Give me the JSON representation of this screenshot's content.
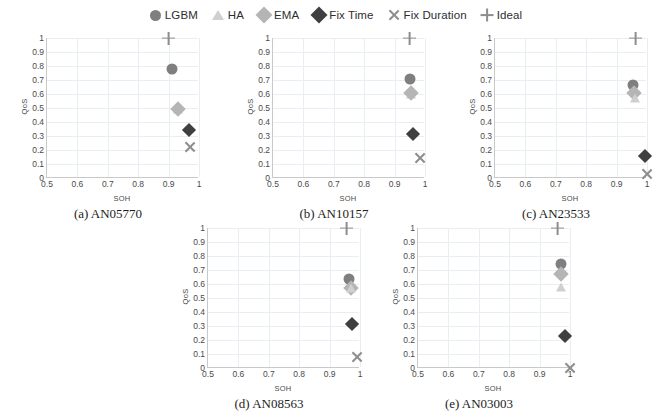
{
  "figure": {
    "xlabel": "SOH",
    "ylabel": "QoS",
    "xlim": [
      0.5,
      1.0
    ],
    "ylim": [
      0.0,
      1.0
    ],
    "xticks": [
      "0.5",
      "0.6",
      "0.7",
      "0.8",
      "0.9",
      "1"
    ],
    "yticks": [
      "0",
      "0.1",
      "0.2",
      "0.3",
      "0.4",
      "0.5",
      "0.6",
      "0.7",
      "0.8",
      "0.9",
      "1"
    ],
    "grid": true,
    "legend_position": "top-center"
  },
  "legend": {
    "items": [
      {
        "label": "LGBM",
        "marker": "circle",
        "color": "#7f7f7f",
        "icon": "circle-marker-icon"
      },
      {
        "label": "HA",
        "marker": "triangle",
        "color": "#cfcfcf",
        "icon": "triangle-marker-icon"
      },
      {
        "label": "EMA",
        "marker": "diamond",
        "color": "#b5b5b5",
        "icon": "diamond-marker-icon"
      },
      {
        "label": "Fix Time",
        "marker": "diamond",
        "color": "#3f3f3f",
        "icon": "diamond-marker-icon"
      },
      {
        "label": "Fix Duration",
        "marker": "x",
        "color": "#8d8d8d",
        "icon": "x-marker-icon"
      },
      {
        "label": "Ideal",
        "marker": "plus",
        "color": "#8d8d8d",
        "icon": "plus-marker-icon"
      }
    ]
  },
  "chart_data": [
    {
      "type": "scatter",
      "id": "a",
      "title": "(a) AN05770",
      "xlabel": "SOH",
      "ylabel": "QoS",
      "xlim": [
        0.5,
        1.0
      ],
      "ylim": [
        0.0,
        1.0
      ],
      "series": [
        {
          "name": "Ideal",
          "marker": "plus",
          "color": "#8d8d8d",
          "size": 13,
          "x": [
            0.9
          ],
          "y": [
            1.0
          ]
        },
        {
          "name": "LGBM",
          "marker": "circle",
          "color": "#7f7f7f",
          "size": 11,
          "x": [
            0.91
          ],
          "y": [
            0.78
          ]
        },
        {
          "name": "HA",
          "marker": "triangle",
          "color": "#cfcfcf",
          "size": 11,
          "x": [
            0.932
          ],
          "y": [
            0.49
          ]
        },
        {
          "name": "EMA",
          "marker": "diamond",
          "color": "#b5b5b5",
          "size": 11,
          "x": [
            0.932
          ],
          "y": [
            0.492
          ]
        },
        {
          "name": "Fix Time",
          "marker": "diamond",
          "color": "#3f3f3f",
          "size": 10,
          "x": [
            0.968
          ],
          "y": [
            0.34
          ]
        },
        {
          "name": "Fix Duration",
          "marker": "x",
          "color": "#8d8d8d",
          "size": 12,
          "x": [
            0.97
          ],
          "y": [
            0.22
          ]
        }
      ]
    },
    {
      "type": "scatter",
      "id": "b",
      "title": "(b) AN10157",
      "xlabel": "SOH",
      "ylabel": "QoS",
      "xlim": [
        0.5,
        1.0
      ],
      "ylim": [
        0.0,
        1.0
      ],
      "series": [
        {
          "name": "Ideal",
          "marker": "plus",
          "color": "#8d8d8d",
          "size": 13,
          "x": [
            0.95
          ],
          "y": [
            1.0
          ]
        },
        {
          "name": "LGBM",
          "marker": "circle",
          "color": "#7f7f7f",
          "size": 11,
          "x": [
            0.95
          ],
          "y": [
            0.705
          ]
        },
        {
          "name": "HA",
          "marker": "triangle",
          "color": "#cfcfcf",
          "size": 11,
          "x": [
            0.955
          ],
          "y": [
            0.6
          ]
        },
        {
          "name": "EMA",
          "marker": "diamond",
          "color": "#b5b5b5",
          "size": 11,
          "x": [
            0.955
          ],
          "y": [
            0.608
          ]
        },
        {
          "name": "Fix Time",
          "marker": "diamond",
          "color": "#3f3f3f",
          "size": 10,
          "x": [
            0.96
          ],
          "y": [
            0.315
          ]
        },
        {
          "name": "Fix Duration",
          "marker": "x",
          "color": "#8d8d8d",
          "size": 12,
          "x": [
            0.985
          ],
          "y": [
            0.14
          ]
        }
      ]
    },
    {
      "type": "scatter",
      "id": "c",
      "title": "(c) AN23533",
      "xlabel": "SOH",
      "ylabel": "QoS",
      "xlim": [
        0.5,
        1.0
      ],
      "ylim": [
        0.0,
        1.0
      ],
      "series": [
        {
          "name": "Ideal",
          "marker": "plus",
          "color": "#8d8d8d",
          "size": 13,
          "x": [
            0.962
          ],
          "y": [
            1.0
          ]
        },
        {
          "name": "LGBM",
          "marker": "circle",
          "color": "#7f7f7f",
          "size": 11,
          "x": [
            0.955
          ],
          "y": [
            0.665
          ]
        },
        {
          "name": "EMA",
          "marker": "diamond",
          "color": "#b5b5b5",
          "size": 11,
          "x": [
            0.958
          ],
          "y": [
            0.605
          ]
        },
        {
          "name": "HA",
          "marker": "triangle",
          "color": "#cfcfcf",
          "size": 11,
          "x": [
            0.96
          ],
          "y": [
            0.575
          ]
        },
        {
          "name": "Fix Time",
          "marker": "diamond",
          "color": "#3f3f3f",
          "size": 10,
          "x": [
            0.995
          ],
          "y": [
            0.155
          ]
        },
        {
          "name": "Fix Duration",
          "marker": "x",
          "color": "#8d8d8d",
          "size": 12,
          "x": [
            1.0
          ],
          "y": [
            0.03
          ]
        }
      ]
    },
    {
      "type": "scatter",
      "id": "d",
      "title": "(d) AN08563",
      "xlabel": "SOH",
      "ylabel": "QoS",
      "xlim": [
        0.5,
        1.0
      ],
      "ylim": [
        0.0,
        1.0
      ],
      "series": [
        {
          "name": "Ideal",
          "marker": "plus",
          "color": "#8d8d8d",
          "size": 13,
          "x": [
            0.955
          ],
          "y": [
            1.0
          ]
        },
        {
          "name": "LGBM",
          "marker": "circle",
          "color": "#7f7f7f",
          "size": 11,
          "x": [
            0.965
          ],
          "y": [
            0.635
          ]
        },
        {
          "name": "EMA",
          "marker": "diamond",
          "color": "#b5b5b5",
          "size": 11,
          "x": [
            0.97
          ],
          "y": [
            0.575
          ]
        },
        {
          "name": "HA",
          "marker": "triangle",
          "color": "#cfcfcf",
          "size": 11,
          "x": [
            0.97
          ],
          "y": [
            0.57
          ]
        },
        {
          "name": "Fix Time",
          "marker": "diamond",
          "color": "#3f3f3f",
          "size": 10,
          "x": [
            0.975
          ],
          "y": [
            0.315
          ]
        },
        {
          "name": "Fix Duration",
          "marker": "x",
          "color": "#8d8d8d",
          "size": 12,
          "x": [
            0.99
          ],
          "y": [
            0.08
          ]
        }
      ]
    },
    {
      "type": "scatter",
      "id": "e",
      "title": "(e) AN03003",
      "xlabel": "SOH",
      "ylabel": "QoS",
      "xlim": [
        0.5,
        1.0
      ],
      "ylim": [
        0.0,
        1.0
      ],
      "series": [
        {
          "name": "Ideal",
          "marker": "plus",
          "color": "#8d8d8d",
          "size": 13,
          "x": [
            0.958
          ],
          "y": [
            1.0
          ]
        },
        {
          "name": "LGBM",
          "marker": "circle",
          "color": "#7f7f7f",
          "size": 11,
          "x": [
            0.97
          ],
          "y": [
            0.74
          ]
        },
        {
          "name": "EMA",
          "marker": "diamond",
          "color": "#b5b5b5",
          "size": 11,
          "x": [
            0.97
          ],
          "y": [
            0.67
          ]
        },
        {
          "name": "HA",
          "marker": "triangle",
          "color": "#cfcfcf",
          "size": 11,
          "x": [
            0.97
          ],
          "y": [
            0.58
          ]
        },
        {
          "name": "Fix Time",
          "marker": "diamond",
          "color": "#3f3f3f",
          "size": 10,
          "x": [
            0.985
          ],
          "y": [
            0.23
          ]
        },
        {
          "name": "Fix Duration",
          "marker": "x",
          "color": "#8d8d8d",
          "size": 12,
          "x": [
            1.0
          ],
          "y": [
            0.0
          ]
        }
      ]
    }
  ]
}
